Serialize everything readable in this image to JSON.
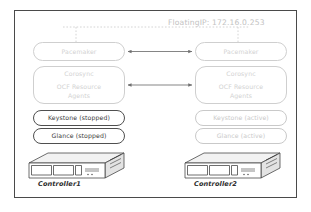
{
  "diagram": {
    "frame_border_color": "#4a4a4a",
    "floating_ip_label": "FloatingIP: 172.16.0.253",
    "colors": {
      "faint_stroke": "#cfcfcf",
      "faint_text": "#d2d2d2",
      "active_stroke": "#4f4f4f",
      "active_text": "#3a3a3a",
      "arrow": "#6f6f6f",
      "dashed_line": "#c9c9c9",
      "server_stroke": "#3d3d3d",
      "server_top_fill": "#f2f2f2",
      "server_front_fill": "#ffffff",
      "server_side_fill": "#e3e3e3"
    }
  },
  "left_node": {
    "server_label": "Controller1",
    "pacemaker": {
      "label": "Pacemaker",
      "state": "faint"
    },
    "corosync": {
      "line1": "Corosync",
      "line2": "OCF Resource",
      "line3": "Agents",
      "state": "faint"
    },
    "keystone": {
      "label": "Keystone (stopped)",
      "state": "stopped"
    },
    "glance": {
      "label": "Glance (stopped)",
      "state": "stopped"
    }
  },
  "right_node": {
    "server_label": "Controller2",
    "pacemaker": {
      "label": "Pacemaker",
      "state": "faint"
    },
    "corosync": {
      "line1": "Corosync",
      "line2": "OCF Resource",
      "line3": "Agents",
      "state": "faint"
    },
    "keystone": {
      "label": "Keystone (active)",
      "state": "active"
    },
    "glance": {
      "label": "Glance (active)",
      "state": "active"
    }
  },
  "connectors": {
    "pacemaker_link": "bidirectional-arrow",
    "corosync_link": "bidirectional-arrow",
    "floating_ip_link": "dashed-bracket"
  },
  "icons": {
    "server": "rack-server-icon",
    "arrow": "double-arrow-icon"
  }
}
